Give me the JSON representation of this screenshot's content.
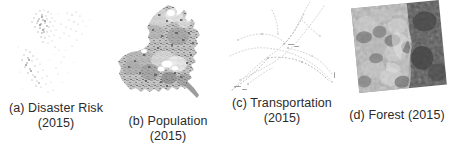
{
  "figure": {
    "background_color": "#ffffff",
    "caption_color": "#2b2b2b",
    "panel_count": 4
  },
  "panels": [
    {
      "id": "a",
      "letter": "(a)",
      "title": "Disaster Risk",
      "year": "(2015)",
      "caption_line1": "(a) Disaster Risk",
      "caption_line2": "(2015)",
      "map_type": "point-density",
      "description": "Very faint light-gray scattered points forming a country outline",
      "palette": [
        "#d8d8d8",
        "#b9b9b9",
        "#8e8e8e"
      ]
    },
    {
      "id": "b",
      "letter": "(b)",
      "title": "Population",
      "year": "(2015)",
      "caption_line1": "(b) Population",
      "caption_line2": "(2015)",
      "map_type": "choropleth-polygon",
      "description": "Filled gray administrative polygon with mottled darker population clusters",
      "palette": [
        "#efefef",
        "#c9c9c9",
        "#a8a8a8",
        "#808080",
        "#5a5a5a"
      ]
    },
    {
      "id": "c",
      "letter": "(c)",
      "title": "Transportation",
      "year": "(2015)",
      "caption_line1": "(c) Transportation",
      "caption_line2": "(2015)",
      "map_type": "network-lines",
      "description": "Very faint dotted road/rail network lines crossing the frame",
      "palette": [
        "#e3e3e3",
        "#cfcfcf",
        "#b0b0b0"
      ]
    },
    {
      "id": "d",
      "letter": "(d)",
      "title": "Forest (2015)",
      "year": "(2015)",
      "caption_line1": "(d) Forest (2015)",
      "caption_line2": "",
      "map_type": "raster-image",
      "description": "Rotated grayscale satellite raster tile; mottled light terrain at left, dark band at right",
      "rotation_deg": -5.5,
      "palette": [
        "#d5d5d5",
        "#b0b0b0",
        "#8d8d8d",
        "#6b6b6b",
        "#4a4a4a"
      ]
    }
  ]
}
